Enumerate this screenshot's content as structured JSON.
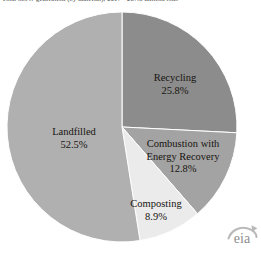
{
  "figure": {
    "caption": "Total MSW generation (by material), 2017 - 267.8 million tons",
    "logo": {
      "name": "eia",
      "text": "eia",
      "swoosh_icon": "eia-swoosh-icon"
    }
  },
  "colors": {
    "background": "#ffffff",
    "recycling": "#8c8c8c",
    "combustion": "#a3a3a3",
    "composting": "#ebebeb",
    "landfilled": "#b0b0b0",
    "slice_border": "#ffffff",
    "label_text": "#17140f",
    "caption_text": "#3a3a3a",
    "logo_gray": "#8d8d8d"
  },
  "chart_data": {
    "type": "pie",
    "title": "",
    "xlabel": "",
    "ylabel": "",
    "legend_position": "none",
    "grid": false,
    "start_angle_deg": 0,
    "direction": "clockwise",
    "labels": [
      "Recycling",
      "Combustion with Energy Recovery",
      "Composting",
      "Landfilled"
    ],
    "values": [
      25.8,
      12.8,
      8.9,
      52.5
    ],
    "units": "percent",
    "slices": [
      {
        "name": "Recycling",
        "label_line1": "Recycling",
        "label_line2": "",
        "value": 25.8,
        "value_label": "25.8%",
        "color": "#8c8c8c"
      },
      {
        "name": "Combustion with Energy Recovery",
        "label_line1": "Combustion with",
        "label_line2": "Energy Recovery",
        "value": 12.8,
        "value_label": "12.8%",
        "color": "#a3a3a3"
      },
      {
        "name": "Composting",
        "label_line1": "Composting",
        "label_line2": "",
        "value": 8.9,
        "value_label": "8.9%",
        "color": "#ebebeb"
      },
      {
        "name": "Landfilled",
        "label_line1": "Landfilled",
        "label_line2": "",
        "value": 52.5,
        "value_label": "52.5%",
        "color": "#b0b0b0"
      }
    ]
  }
}
